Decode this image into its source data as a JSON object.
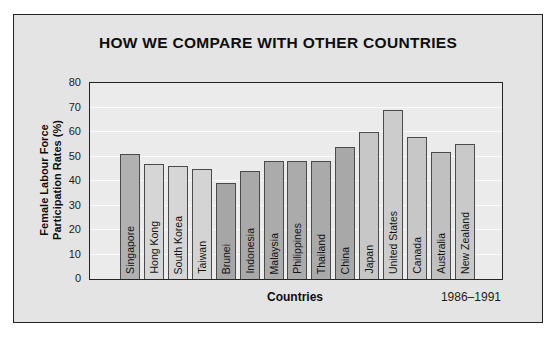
{
  "title": "HOW WE COMPARE WITH OTHER COUNTRIES",
  "chart_data": {
    "type": "bar",
    "title": "HOW WE COMPARE WITH OTHER COUNTRIES",
    "categories": [
      "Singapore",
      "Hong Kong",
      "South Korea",
      "Taiwan",
      "Brunei",
      "Indonesia",
      "Malaysia",
      "Philippines",
      "Thailand",
      "China",
      "Japan",
      "United States",
      "Canada",
      "Australia",
      "New Zealand"
    ],
    "values": [
      51,
      47,
      46,
      45,
      39,
      44,
      48,
      48,
      48,
      54,
      60,
      69,
      58,
      52,
      55
    ],
    "bar_colors": [
      "#b1b1b1",
      "#d6d6d6",
      "#d6d6d6",
      "#d4d4d4",
      "#a6a6a6",
      "#a9a9a9",
      "#ababab",
      "#ababab",
      "#aaaaaa",
      "#a8a8a8",
      "#c7c7c7",
      "#cccccc",
      "#c7c7c7",
      "#c0c0c0",
      "#c9c9c9"
    ],
    "xlabel": "Countries",
    "ylabel": "Female Labour Force Participation Rates (%)",
    "ylabel_lines": [
      "Female Labour Force",
      "Participation Rates (%)"
    ],
    "ylim": [
      0,
      80
    ],
    "yticks": [
      0,
      10,
      20,
      30,
      40,
      50,
      60,
      70,
      80
    ],
    "grid": true,
    "gridline_color": "#fafafa",
    "legend": false,
    "period_note": "1986–1991",
    "frame_background": "#e4e4e4",
    "plot_background": "#ebebeb"
  }
}
